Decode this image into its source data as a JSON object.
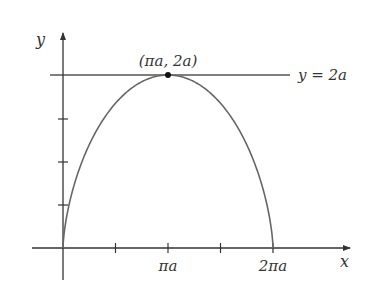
{
  "diagram": {
    "type": "cycloid-arch",
    "axes": {
      "x_label": "x",
      "y_label": "y",
      "x_tick_labels": [
        "πa",
        "2πa"
      ],
      "x_ticks_count": 4,
      "y_ticks_count": 3
    },
    "horizontal_line_label": "y = 2a",
    "peak_point_label": "(πa, 2a)",
    "colors": {
      "axis": "#333333",
      "curve": "#666666",
      "line": "#555555",
      "point": "#111111",
      "text": "#333333"
    }
  }
}
